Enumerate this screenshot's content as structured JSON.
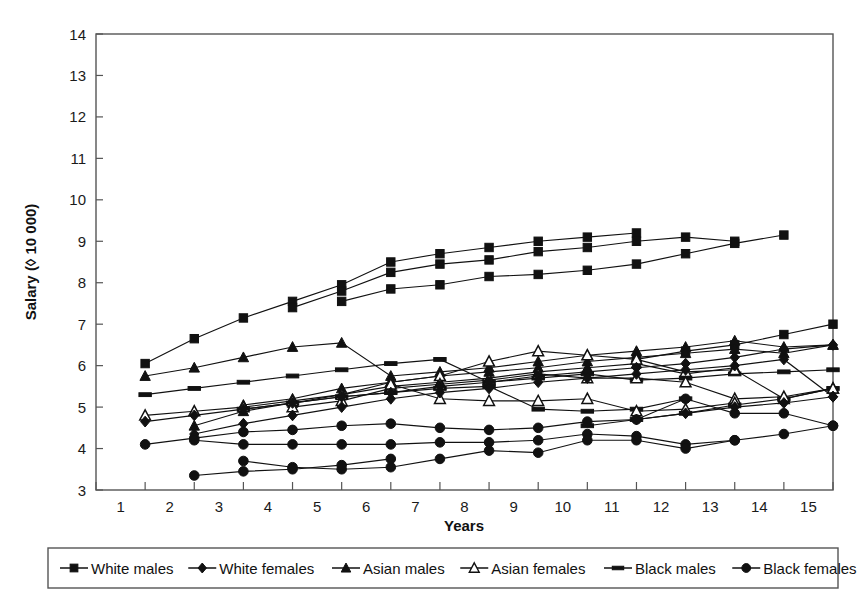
{
  "chart_data": {
    "type": "line",
    "title": "",
    "xlabel": "Years",
    "ylabel": "Salary (◊ 10 000)",
    "xlim": [
      0,
      15
    ],
    "ylim": [
      3,
      14
    ],
    "grid": false,
    "legend_position": "bottom",
    "xticks": [
      1,
      2,
      3,
      4,
      5,
      6,
      7,
      8,
      9,
      10,
      11,
      12,
      13,
      14,
      15
    ],
    "yticks": [
      3,
      4,
      5,
      6,
      7,
      8,
      9,
      10,
      11,
      12,
      13,
      14
    ],
    "xtick_labels": [
      "1",
      "2",
      "3",
      "4",
      "5",
      "6",
      "7",
      "8",
      "9",
      "10",
      "11",
      "12",
      "13",
      "14",
      "15"
    ],
    "ytick_labels": [
      "3",
      "4",
      "5",
      "6",
      "7",
      "8",
      "9",
      "10",
      "11",
      "12",
      "13",
      "14"
    ],
    "legend": [
      {
        "label": "White males",
        "marker": "filled-square"
      },
      {
        "label": "White females",
        "marker": "filled-diamond"
      },
      {
        "label": "Asian males",
        "marker": "filled-triangle"
      },
      {
        "label": "Asian females",
        "marker": "open-triangle"
      },
      {
        "label": "Black males",
        "marker": "dash"
      },
      {
        "label": "Black females",
        "marker": "filled-circle"
      }
    ],
    "series": [
      {
        "name": "White males",
        "marker": "filled-square",
        "group": "white-males",
        "x": [
          1,
          2,
          3,
          4,
          5,
          6,
          7,
          8,
          9,
          10,
          11
        ],
        "values": [
          6.05,
          6.65,
          7.15,
          7.55,
          7.95,
          8.5,
          8.7,
          8.85,
          9.0,
          9.1,
          9.2
        ]
      },
      {
        "name": "White males",
        "marker": "filled-square",
        "group": "white-males",
        "x": [
          4,
          5,
          6,
          7,
          8,
          9,
          10,
          11,
          12,
          13
        ],
        "values": [
          7.4,
          7.8,
          8.25,
          8.45,
          8.55,
          8.75,
          8.85,
          9.0,
          9.1,
          9.0
        ]
      },
      {
        "name": "White males",
        "marker": "filled-square",
        "group": "white-males",
        "x": [
          5,
          6,
          7,
          8,
          9,
          10,
          11,
          12,
          13,
          14
        ],
        "values": [
          7.55,
          7.85,
          7.95,
          8.15,
          8.2,
          8.3,
          8.45,
          8.7,
          8.95,
          9.15
        ]
      },
      {
        "name": "White males",
        "marker": "filled-square",
        "group": "white-males",
        "x": [
          11,
          12,
          13,
          14,
          15
        ],
        "values": [
          6.15,
          6.35,
          6.5,
          6.75,
          7.0
        ]
      },
      {
        "name": "Asian males",
        "marker": "filled-triangle",
        "group": "asian-males",
        "x": [
          1,
          2,
          3,
          4,
          5,
          6,
          7,
          8,
          9,
          10,
          11,
          12,
          13,
          14,
          15
        ],
        "values": [
          5.75,
          5.95,
          6.2,
          6.45,
          6.55,
          5.75,
          5.85,
          5.95,
          6.1,
          6.25,
          6.35,
          6.45,
          6.6,
          6.45,
          6.5
        ]
      },
      {
        "name": "Asian males",
        "marker": "filled-triangle",
        "group": "asian-males",
        "x": [
          3,
          4,
          5,
          6,
          7,
          8,
          9,
          10,
          11,
          12,
          13,
          14,
          15
        ],
        "values": [
          5.05,
          5.2,
          5.45,
          5.6,
          5.75,
          5.85,
          5.95,
          6.1,
          6.2,
          6.3,
          6.4,
          6.3,
          6.5
        ]
      },
      {
        "name": "Asian males",
        "marker": "filled-triangle",
        "group": "asian-males",
        "x": [
          2,
          3,
          4,
          5,
          6,
          7,
          8,
          9,
          10,
          11,
          12,
          13
        ],
        "values": [
          4.55,
          4.9,
          5.1,
          5.3,
          5.5,
          5.6,
          5.7,
          5.85,
          5.95,
          6.05,
          5.8,
          5.95
        ]
      },
      {
        "name": "Black males",
        "marker": "dash",
        "group": "black-males",
        "x": [
          1,
          2,
          3,
          4,
          5,
          6,
          7,
          8,
          9,
          10,
          11,
          12,
          13,
          14,
          15
        ],
        "values": [
          5.3,
          5.45,
          5.6,
          5.75,
          5.9,
          6.05,
          6.15,
          5.6,
          5.7,
          5.8,
          5.65,
          5.7,
          5.8,
          5.85,
          5.9
        ]
      },
      {
        "name": "Black males",
        "marker": "dash",
        "group": "black-males",
        "x": [
          3,
          4,
          5,
          6,
          7,
          8,
          9,
          10,
          11,
          12
        ],
        "values": [
          4.95,
          5.1,
          5.25,
          5.35,
          5.45,
          5.5,
          4.95,
          4.9,
          4.95,
          5.2
        ]
      },
      {
        "name": "Black males",
        "marker": "dash",
        "group": "black-males",
        "x": [
          10,
          11,
          12,
          13,
          14,
          15
        ],
        "values": [
          4.55,
          4.7,
          4.85,
          5.05,
          5.2,
          5.45
        ]
      },
      {
        "name": "Asian females",
        "marker": "open-triangle",
        "group": "asian-females",
        "x": [
          1,
          2,
          3,
          4,
          5,
          6,
          7,
          8,
          9,
          10,
          11,
          12,
          13,
          14,
          15
        ],
        "values": [
          4.8,
          4.9,
          5.0,
          5.15,
          5.3,
          5.6,
          5.75,
          6.1,
          6.35,
          6.25,
          6.15,
          5.85,
          5.9,
          5.2,
          5.45
        ]
      },
      {
        "name": "Asian females",
        "marker": "open-triangle",
        "group": "asian-females",
        "x": [
          4,
          5,
          6,
          7,
          8,
          9,
          10,
          11,
          12,
          13,
          14,
          15
        ],
        "values": [
          5.0,
          5.15,
          5.45,
          5.55,
          5.65,
          5.8,
          5.7,
          5.7,
          5.6,
          5.2,
          5.25,
          5.45
        ]
      },
      {
        "name": "Asian females",
        "marker": "open-triangle",
        "group": "asian-females",
        "x": [
          6,
          7,
          8,
          9,
          10,
          11,
          12,
          13
        ],
        "values": [
          5.55,
          5.2,
          5.15,
          5.15,
          5.2,
          4.9,
          4.95,
          5.1
        ]
      },
      {
        "name": "White females",
        "marker": "filled-diamond",
        "group": "white-females",
        "x": [
          1,
          2,
          3,
          4,
          5,
          6,
          7,
          8,
          9,
          10,
          11,
          12,
          13,
          14,
          15
        ],
        "values": [
          4.65,
          4.8,
          4.95,
          5.1,
          5.25,
          5.35,
          5.5,
          5.6,
          5.75,
          5.85,
          5.95,
          6.05,
          6.2,
          6.4,
          6.5
        ]
      },
      {
        "name": "White females",
        "marker": "filled-diamond",
        "group": "white-females",
        "x": [
          2,
          3,
          4,
          5,
          6,
          7,
          8,
          9,
          10,
          11,
          12,
          13,
          14,
          15
        ],
        "values": [
          4.35,
          4.6,
          4.8,
          5.0,
          5.2,
          5.35,
          5.45,
          5.6,
          5.7,
          5.8,
          5.9,
          6.0,
          6.15,
          5.25
        ]
      },
      {
        "name": "White females",
        "marker": "filled-diamond",
        "group": "white-females",
        "x": [
          11,
          12,
          13,
          14,
          15
        ],
        "values": [
          4.7,
          4.85,
          5.0,
          5.1,
          5.25
        ]
      },
      {
        "name": "Black females",
        "marker": "filled-circle",
        "group": "black-females",
        "x": [
          1,
          2,
          3,
          4,
          5,
          6,
          7,
          8,
          9,
          10,
          11,
          12,
          13,
          14,
          15
        ],
        "values": [
          4.1,
          4.25,
          4.4,
          4.45,
          4.55,
          4.6,
          4.5,
          4.45,
          4.5,
          4.65,
          4.7,
          5.2,
          4.85,
          4.85,
          4.55
        ]
      },
      {
        "name": "Black females",
        "marker": "filled-circle",
        "group": "black-females",
        "x": [
          2,
          3,
          4,
          5,
          6,
          7,
          8,
          9,
          10,
          11,
          12,
          13
        ],
        "values": [
          4.2,
          4.1,
          4.1,
          4.1,
          4.1,
          4.15,
          4.15,
          4.2,
          4.35,
          4.3,
          4.1,
          4.2
        ]
      },
      {
        "name": "Black females",
        "marker": "filled-circle",
        "group": "black-females",
        "x": [
          3,
          4,
          5,
          6,
          7,
          8,
          9,
          10,
          11,
          12,
          13,
          14,
          15
        ],
        "values": [
          3.7,
          3.55,
          3.5,
          3.55,
          3.75,
          3.95,
          3.9,
          4.2,
          4.2,
          4.0,
          4.2,
          4.35,
          4.55
        ]
      },
      {
        "name": "Black females",
        "marker": "filled-circle",
        "group": "black-females",
        "x": [
          2,
          3,
          4,
          5,
          6
        ],
        "values": [
          3.35,
          3.45,
          3.5,
          3.6,
          3.75
        ]
      }
    ]
  }
}
